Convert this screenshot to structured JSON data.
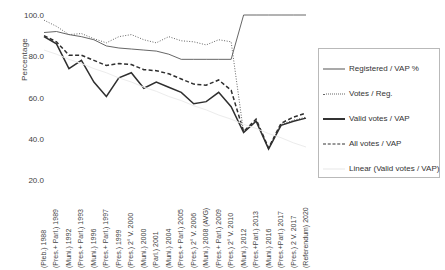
{
  "chart_data": {
    "type": "line",
    "title": "",
    "xlabel": "",
    "ylabel": "Percentage",
    "ylim": [
      20.0,
      100.0
    ],
    "yticks": [
      100.0,
      80.0,
      60.0,
      40.0,
      20.0
    ],
    "ytick_labels": [
      "100.0",
      "80.0",
      "60.0",
      "40.0",
      "20.0"
    ],
    "grid": false,
    "legend_position": "right",
    "categories": [
      "(Pleb.) 1988",
      "(Pres.+ Parl.) 1989",
      "(Muni.) 1992",
      "(Pres.+ Parl.) 1993",
      "(Muni.) 1996",
      "(Pres.+ Parl.) 1997",
      "(Pres.) 1999",
      "(Pres.) 2° V. 2000",
      "(Muni.) 2000",
      "(Parl.) 2001",
      "(Muni.) 2004",
      "(Pres.+ Parl.) 2005",
      "(Pres.) 2° V. 2006",
      "(Muni.) 2008 (AVG)",
      "(Pres.+ Parl.) 2009",
      "(Pres.) 2° V. 2010",
      "(Muni.) 2012",
      "(Pres.+Parl.) 2013",
      "(Muni.) 2016",
      "(Pres.+Parl.) 2017",
      "(Pres.) 2 V. 2017",
      "(Referendum) 2020"
    ],
    "series": [
      {
        "name": "Registered / VAP %",
        "style": "thin-solid",
        "color": "#555555",
        "values": [
          91.5,
          92.0,
          90.5,
          89.5,
          88.0,
          85.0,
          84.0,
          83.5,
          83.0,
          82.5,
          81.0,
          78.5,
          78.5,
          78.5,
          78.5,
          78.5,
          100.0,
          100.0,
          100.0,
          100.0,
          100.0,
          100.0
        ]
      },
      {
        "name": "Votes / Reg.",
        "style": "dotted",
        "color": "#666666",
        "values": [
          97.5,
          94.5,
          90.5,
          91.0,
          88.5,
          86.5,
          89.5,
          90.5,
          88.0,
          86.5,
          89.5,
          87.5,
          87.0,
          85.5,
          88.0,
          87.0,
          43.0,
          49.0,
          35.5,
          47.0,
          49.0,
          50.5
        ]
      },
      {
        "name": "Valid votes / VAP",
        "style": "thick-solid",
        "color": "#333333",
        "values": [
          89.5,
          86.0,
          74.0,
          78.0,
          67.5,
          60.5,
          69.5,
          72.0,
          64.5,
          67.5,
          65.0,
          62.5,
          57.0,
          58.0,
          62.5,
          55.5,
          43.0,
          48.5,
          35.0,
          46.5,
          48.5,
          50.0
        ]
      },
      {
        "name": "All votes / VAP",
        "style": "dashed",
        "color": "#333333",
        "values": [
          90.0,
          87.0,
          80.5,
          80.5,
          78.0,
          75.5,
          76.5,
          76.0,
          73.5,
          73.0,
          71.5,
          69.0,
          66.5,
          66.0,
          68.5,
          63.5,
          43.5,
          49.5,
          35.5,
          47.5,
          50.5,
          52.5
        ]
      },
      {
        "name": "Linear (Valid votes / VAP)",
        "style": "trend-faint",
        "color": "#e8e8e8",
        "values": [
          83.0,
          81.0,
          78.5,
          76.5,
          74.0,
          72.0,
          69.5,
          67.5,
          65.0,
          63.0,
          60.5,
          58.5,
          56.0,
          54.0,
          51.5,
          49.5,
          47.0,
          45.0,
          42.5,
          40.5,
          38.0,
          36.0
        ]
      }
    ]
  },
  "legend": {
    "items": [
      {
        "label": "Registered / VAP %",
        "swatch": "thin-line-swatch"
      },
      {
        "label": "Votes / Reg.",
        "swatch": "dotted-line-swatch"
      },
      {
        "label": "Valid votes / VAP",
        "swatch": "thick-line-swatch"
      },
      {
        "label": "All votes / VAP",
        "swatch": "dashed-line-swatch"
      },
      {
        "label": "Linear (Valid votes / VAP)",
        "swatch": "faint-line-swatch"
      }
    ]
  }
}
